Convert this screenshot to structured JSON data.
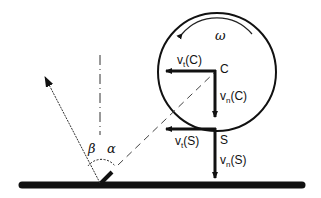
{
  "diagram": {
    "labels": {
      "center": "C",
      "contact": "S",
      "omega": "ω",
      "vt_center": "vt(C)",
      "vn_center": "vn(C)",
      "vt_contact": "vt(S)",
      "vn_contact": "vn(S)",
      "alpha": "α",
      "beta": "β"
    },
    "label_parts": {
      "vt_c": {
        "v": "v",
        "sub": "t",
        "arg": "(C)"
      },
      "vn_c": {
        "v": "v",
        "sub": "n",
        "arg": "(C)"
      },
      "vt_s": {
        "v": "v",
        "sub": "t",
        "arg": "(S)"
      },
      "vn_s": {
        "v": "v",
        "sub": "n",
        "arg": "(S)"
      }
    },
    "colors": {
      "ink": "#111111",
      "background": "#ffffff"
    }
  }
}
